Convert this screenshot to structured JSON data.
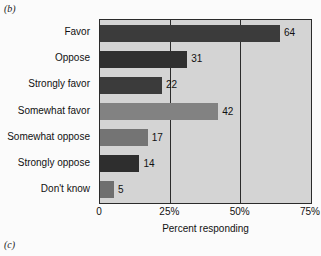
{
  "figure": {
    "panel_label_b": "(b)",
    "panel_label_c": "(c)"
  },
  "chart_data": {
    "type": "bar",
    "orientation": "horizontal",
    "title": "",
    "xlabel": "Percent responding",
    "ylabel": "",
    "xlim": [
      0,
      75
    ],
    "xticks": [
      0,
      25,
      50,
      75
    ],
    "xtick_labels": [
      "0",
      "25%",
      "50%",
      "75%"
    ],
    "grid": true,
    "grid_axis": "x",
    "legend": "none",
    "categories": [
      "Favor",
      "Oppose",
      "Strongly favor",
      "Somewhat favor",
      "Somewhat oppose",
      "Strongly oppose",
      "Don't know"
    ],
    "values": [
      64,
      31,
      22,
      42,
      17,
      14,
      5
    ],
    "value_labels": [
      "64",
      "31",
      "22",
      "42",
      "17",
      "14",
      "5"
    ],
    "bar_colors": [
      "#3b3b3b",
      "#303030",
      "#3b3b3b",
      "#828282",
      "#747474",
      "#2e2e2e",
      "#6f6f6f"
    ],
    "plot_background": "#d4d4d4",
    "axis_color": "#2b2b2b",
    "text_color": "#111111"
  }
}
